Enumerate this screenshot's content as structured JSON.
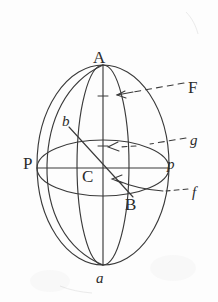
{
  "figure": {
    "background_color": "#fdfdfd",
    "ink_color": "#3a3a3a",
    "labels": {
      "top_pole": "A",
      "bottom_pole": "a",
      "equator_left": "P",
      "equator_right": "p",
      "center": "C",
      "diagonal_end": "B",
      "meridian_arc": "b",
      "upper_circle": "F",
      "equator_callout": "g",
      "lower_circle": "f"
    },
    "callouts": [
      {
        "label": "F",
        "style": "dashed-leader-with-arrow",
        "points_to": "upper parallel circle"
      },
      {
        "label": "g",
        "style": "dashed-leader-with-arrow",
        "points_to": "equator circle"
      },
      {
        "label": "f",
        "style": "dashed-leader-with-arrow",
        "points_to": "lower parallel circle"
      }
    ],
    "geometry": {
      "outer_ellipse": {
        "cx": 103,
        "cy": 165,
        "rx": 66,
        "ry": 100
      },
      "inner_meridian": {
        "cx": 103,
        "cy": 165,
        "rx": 26,
        "ry": 100
      },
      "equator_ellipse": {
        "cx": 103,
        "cy": 168,
        "rx": 66,
        "ry": 28
      },
      "polar_axis": {
        "x": 103,
        "y1": 65,
        "y2": 265
      },
      "equatorial_axis": {
        "y": 168,
        "x1": 37,
        "x2": 169
      },
      "diagonal_CB": {
        "x1": 69,
        "y1": 127,
        "x2": 131,
        "y2": 195
      }
    }
  }
}
